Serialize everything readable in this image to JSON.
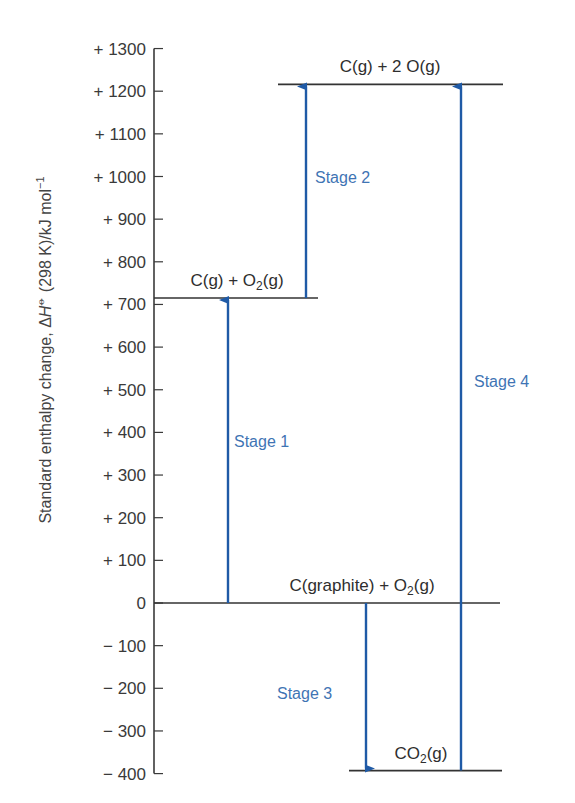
{
  "chart_data": {
    "type": "energy-level-diagram",
    "title": "",
    "ylabel": "Standard enthalpy change, ΔH⦵ (298 K)/kJ mol⁻¹",
    "ylabel_parts": {
      "prefix": "Standard enthalpy change, Δ",
      "symbol": "H",
      "superscript": "⦵",
      "suffix": " (298 K)/kJ mol",
      "unit_exp": "−1"
    },
    "ylim": [
      -400,
      1300
    ],
    "yticks": [
      {
        "value": 1300,
        "label": "+ 1300"
      },
      {
        "value": 1200,
        "label": "+ 1200"
      },
      {
        "value": 1100,
        "label": "+ 1100"
      },
      {
        "value": 1000,
        "label": "+ 1000"
      },
      {
        "value": 900,
        "label": "+ 900"
      },
      {
        "value": 800,
        "label": "+ 800"
      },
      {
        "value": 700,
        "label": "+ 700"
      },
      {
        "value": 600,
        "label": "+ 600"
      },
      {
        "value": 500,
        "label": "+ 500"
      },
      {
        "value": 400,
        "label": "+ 400"
      },
      {
        "value": 300,
        "label": "+ 300"
      },
      {
        "value": 200,
        "label": "+ 200"
      },
      {
        "value": 100,
        "label": "+ 100"
      },
      {
        "value": 0,
        "label": "0"
      },
      {
        "value": -100,
        "label": "− 100"
      },
      {
        "value": -200,
        "label": "− 200"
      },
      {
        "value": -300,
        "label": "− 300"
      },
      {
        "value": -400,
        "label": "− 400"
      }
    ],
    "levels": [
      {
        "id": "c-2o",
        "label_main": "C(g) + 2 O(g)",
        "value": 1216,
        "x1": 278,
        "x2": 503,
        "label_x": 390
      },
      {
        "id": "c-o2",
        "label_main": "C(g) + O",
        "label_sub": "2",
        "label_tail": "(g)",
        "value": 715,
        "x1": 154,
        "x2": 318,
        "label_x": 237
      },
      {
        "id": "graphite-o2",
        "label_main": "C(graphite) + O",
        "label_sub": "2",
        "label_tail": "(g)",
        "value": 0,
        "x1": 154,
        "x2": 500,
        "label_x": 362
      },
      {
        "id": "co2",
        "label_main": "CO",
        "label_sub": "2",
        "label_tail": "(g)",
        "value": -393,
        "x1": 349,
        "x2": 502,
        "label_x": 421
      }
    ],
    "arrows": [
      {
        "id": "stage-1",
        "label": "Stage 1",
        "x": 228,
        "from": 0,
        "to": 715,
        "label_x": 234,
        "label_value": 380
      },
      {
        "id": "stage-2",
        "label": "Stage 2",
        "x": 306,
        "from": 715,
        "to": 1216,
        "label_x": 315,
        "label_value": 1000
      },
      {
        "id": "stage-3",
        "label": "Stage 3",
        "x": 366,
        "from": 0,
        "to": -393,
        "label_x": 277,
        "label_value": -210
      },
      {
        "id": "stage-4",
        "label": "Stage 4",
        "x": 461,
        "from": -393,
        "to": 1216,
        "label_x": 474,
        "label_value": 520
      }
    ],
    "colors": {
      "axis": "#3a3a3a",
      "level": "#333333",
      "arrow": "#1f5aa6",
      "stage_text": "#3f74b4"
    }
  }
}
